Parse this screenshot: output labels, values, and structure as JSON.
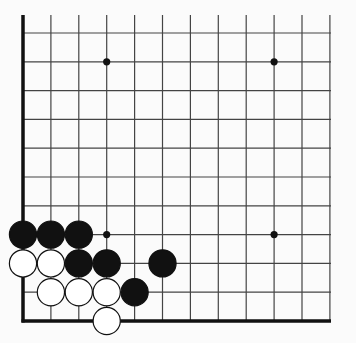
{
  "board": {
    "description": "Go board corner diagram (lower-left corner)",
    "columns": 12,
    "rows": 11,
    "origin_x": 23,
    "origin_y": 33,
    "spacing_x": 27.9,
    "spacing_y": 28.8,
    "top_y": 15,
    "right_x": 331,
    "edges": [
      "left",
      "bottom"
    ],
    "colors": {
      "line": "#444444",
      "edge": "#111111",
      "black": "#111111",
      "white": "#ffffff",
      "background": "#fbfbfb"
    },
    "star_points": [
      {
        "col": 3,
        "row": 1
      },
      {
        "col": 9,
        "row": 1
      },
      {
        "col": 3,
        "row": 7
      },
      {
        "col": 9,
        "row": 7
      }
    ],
    "stones": [
      {
        "color": "black",
        "col": 0,
        "row": 7
      },
      {
        "color": "black",
        "col": 1,
        "row": 7
      },
      {
        "color": "black",
        "col": 2,
        "row": 7
      },
      {
        "color": "white",
        "col": 0,
        "row": 8
      },
      {
        "color": "white",
        "col": 1,
        "row": 8
      },
      {
        "color": "black",
        "col": 2,
        "row": 8
      },
      {
        "color": "black",
        "col": 3,
        "row": 8
      },
      {
        "color": "black",
        "col": 5,
        "row": 8
      },
      {
        "color": "white",
        "col": 1,
        "row": 9
      },
      {
        "color": "white",
        "col": 2,
        "row": 9
      },
      {
        "color": "white",
        "col": 3,
        "row": 9
      },
      {
        "color": "black",
        "col": 4,
        "row": 9
      },
      {
        "color": "white",
        "col": 3,
        "row": 10
      }
    ]
  }
}
